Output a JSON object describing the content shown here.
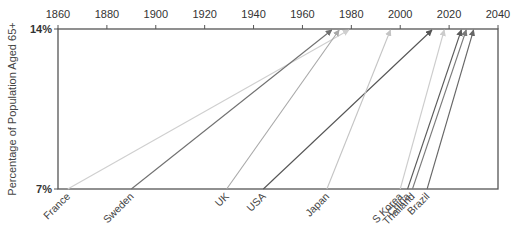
{
  "chart_data": {
    "type": "line",
    "title": "",
    "xlabel": "",
    "ylabel": "Percentage of Population Aged 65+",
    "x_ticks": [
      1860,
      1880,
      1900,
      1920,
      1940,
      1960,
      1980,
      2000,
      2020,
      2040
    ],
    "xlim": [
      1860,
      2040
    ],
    "y_ticks": [
      "14%",
      "7%"
    ],
    "ylim": [
      7,
      14
    ],
    "grid": false,
    "legend": "none",
    "series": [
      {
        "name": "France",
        "start_year": 1864,
        "end_year": 1979,
        "start_pct": 7,
        "end_pct": 14,
        "color": "#cfcfcf"
      },
      {
        "name": "Sweden",
        "start_year": 1890,
        "end_year": 1972,
        "start_pct": 7,
        "end_pct": 14,
        "color": "#707070"
      },
      {
        "name": "UK",
        "start_year": 1929,
        "end_year": 1975,
        "start_pct": 7,
        "end_pct": 14,
        "color": "#a8a8a8"
      },
      {
        "name": "USA",
        "start_year": 1944,
        "end_year": 2013,
        "start_pct": 7,
        "end_pct": 14,
        "color": "#555555"
      },
      {
        "name": "Japan",
        "start_year": 1970,
        "end_year": 1996,
        "start_pct": 7,
        "end_pct": 14,
        "color": "#c4c4c4"
      },
      {
        "name": "S Korea",
        "start_year": 2000,
        "end_year": 2018,
        "start_pct": 7,
        "end_pct": 14,
        "color": "#cccccc"
      },
      {
        "name": "China",
        "start_year": 2003,
        "end_year": 2025,
        "start_pct": 7,
        "end_pct": 14,
        "color": "#5a5a5a"
      },
      {
        "name": "Thailand",
        "start_year": 2005,
        "end_year": 2027,
        "start_pct": 7,
        "end_pct": 14,
        "color": "#7a7a7a"
      },
      {
        "name": "Brazil",
        "start_year": 2011,
        "end_year": 2030,
        "start_pct": 7,
        "end_pct": 14,
        "color": "#666666"
      }
    ]
  },
  "axis": {
    "y_label": "Percentage of Population Aged 65+",
    "y_top": "14%",
    "y_bottom": "7%"
  }
}
